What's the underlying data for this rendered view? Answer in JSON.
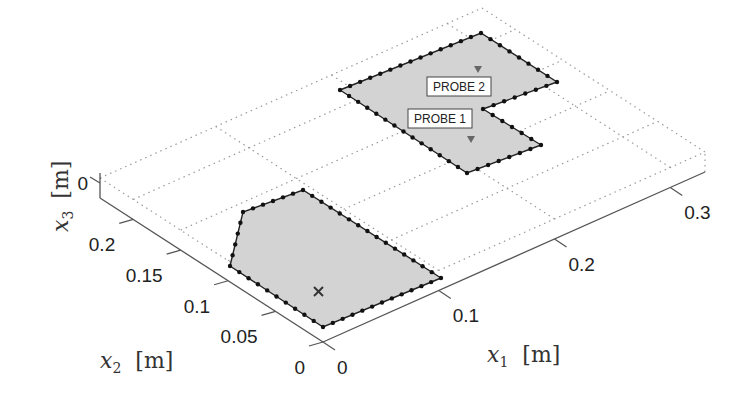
{
  "chart_data": {
    "type": "scatter",
    "projection": "3d",
    "title": "",
    "axes": {
      "x1": {
        "label_var": "x",
        "label_sub": "1",
        "label_unit": "[m]",
        "ticks": [
          0,
          0.1,
          0.2,
          0.3
        ],
        "tick_labels": [
          "0",
          "0.1",
          "0.2",
          "0.3"
        ],
        "range": [
          0,
          0.33
        ]
      },
      "x2": {
        "label_var": "x",
        "label_sub": "2",
        "label_unit": "[m]",
        "ticks": [
          0,
          0.05,
          0.1,
          0.15,
          0.2
        ],
        "tick_labels": [
          "0",
          "0.05",
          "0.1",
          "0.15",
          "0.2"
        ],
        "range": [
          0,
          0.235
        ]
      },
      "x3": {
        "label_var": "x",
        "label_sub": "3",
        "label_unit": "[m]",
        "ticks": [
          0
        ],
        "tick_labels": [
          "0"
        ]
      }
    },
    "grid": true,
    "regions": [
      {
        "name": "lower-domain",
        "fill": "#d3d3d3",
        "vertices": [
          [
            0.005,
            0.095
          ],
          [
            0.005,
            0.15
          ],
          [
            0.025,
            0.17
          ],
          [
            0.115,
            0.135
          ],
          [
            0.075,
            0.02
          ],
          [
            0.005,
            0.02
          ]
        ],
        "marker": {
          "type": "x",
          "position": [
            0.03,
            0.06
          ]
        }
      },
      {
        "name": "upper-domain",
        "fill": "#d3d3d3",
        "vertices": [
          [
            0.17,
            0.2
          ],
          [
            0.27,
            0.23
          ],
          [
            0.3,
            0.17
          ],
          [
            0.255,
            0.16
          ],
          [
            0.26,
            0.1
          ],
          [
            0.215,
            0.09
          ]
        ],
        "probes": [
          {
            "label": "PROBE 1",
            "position": [
              0.24,
              0.12
            ]
          },
          {
            "label": "PROBE 2",
            "position": [
              0.24,
              0.19
            ]
          }
        ]
      }
    ]
  },
  "probes": {
    "p1": "PROBE 1",
    "p2": "PROBE 2"
  },
  "labels": {
    "x1_var": "x",
    "x1_sub": "1",
    "x1_unit": "[m]",
    "x2_var": "x",
    "x2_sub": "2",
    "x2_unit": "[m]",
    "x3_var": "x",
    "x3_sub": "3",
    "x3_unit": "[m]"
  },
  "colors": {
    "region_fill": "#d3d3d3",
    "edge": "#222222",
    "grid": "#9a9a9a",
    "axis": "#555555"
  }
}
